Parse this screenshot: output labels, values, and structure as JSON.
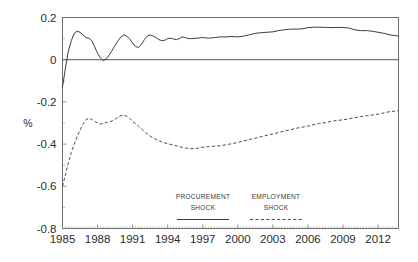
{
  "chart_data": {
    "type": "line",
    "title": "",
    "xlabel": "",
    "ylabel": "%",
    "ylim": [
      -0.8,
      0.2
    ],
    "xlim": [
      1985.0,
      2013.75
    ],
    "yticks": [
      "0.2",
      "0",
      "-0.2",
      "-0.4",
      "-0.6",
      "-0.8"
    ],
    "ytick_values": [
      0.2,
      0,
      -0.2,
      -0.4,
      -0.6,
      -0.8
    ],
    "xticks": [
      "1985",
      "1988",
      "1991",
      "1994",
      "1997",
      "2000",
      "2003",
      "2006",
      "2009",
      "2012"
    ],
    "xtick_values": [
      1985,
      1988,
      1991,
      1994,
      1997,
      2000,
      2003,
      2006,
      2009,
      2012
    ],
    "grid": false,
    "zero_reference_line": 0,
    "legend_position": "inside-bottom-center",
    "series": [
      {
        "name": "PROCUREMENT SHOCK",
        "style": "solid",
        "color": "#3d3d3d",
        "x": [
          1985.0,
          1985.25,
          1985.5,
          1985.75,
          1986.0,
          1986.25,
          1986.5,
          1986.75,
          1987.0,
          1987.25,
          1987.5,
          1987.75,
          1988.0,
          1988.25,
          1988.5,
          1988.75,
          1989.0,
          1989.25,
          1989.5,
          1989.75,
          1990.0,
          1990.25,
          1990.5,
          1990.75,
          1991.0,
          1991.25,
          1991.5,
          1991.75,
          1992.0,
          1992.25,
          1992.5,
          1992.75,
          1993.0,
          1993.25,
          1993.5,
          1993.75,
          1994.0,
          1994.25,
          1994.5,
          1994.75,
          1995.0,
          1995.25,
          1995.5,
          1995.75,
          1996.0,
          1996.5,
          1997.0,
          1997.5,
          1998.0,
          1998.5,
          1999.0,
          1999.5,
          2000.0,
          2000.5,
          2001.0,
          2001.5,
          2002.0,
          2002.5,
          2003.0,
          2003.5,
          2004.0,
          2004.5,
          2005.0,
          2005.5,
          2006.0,
          2006.5,
          2007.0,
          2007.5,
          2008.0,
          2008.5,
          2009.0,
          2009.5,
          2010.0,
          2010.5,
          2011.0,
          2011.5,
          2012.0,
          2012.5,
          2013.0,
          2013.75
        ],
        "y": [
          -0.13,
          -0.04,
          0.04,
          0.09,
          0.125,
          0.135,
          0.13,
          0.118,
          0.105,
          0.102,
          0.09,
          0.062,
          0.03,
          0.008,
          -0.005,
          0.005,
          0.022,
          0.045,
          0.068,
          0.09,
          0.108,
          0.118,
          0.112,
          0.098,
          0.078,
          0.062,
          0.058,
          0.072,
          0.095,
          0.112,
          0.118,
          0.112,
          0.105,
          0.095,
          0.09,
          0.092,
          0.1,
          0.102,
          0.098,
          0.095,
          0.1,
          0.108,
          0.105,
          0.1,
          0.1,
          0.102,
          0.105,
          0.102,
          0.105,
          0.108,
          0.108,
          0.11,
          0.108,
          0.112,
          0.118,
          0.125,
          0.128,
          0.13,
          0.132,
          0.138,
          0.142,
          0.145,
          0.145,
          0.146,
          0.152,
          0.154,
          0.154,
          0.153,
          0.152,
          0.153,
          0.153,
          0.15,
          0.142,
          0.138,
          0.138,
          0.135,
          0.13,
          0.125,
          0.118,
          0.112
        ]
      },
      {
        "name": "EMPLOYMENT SHOCK",
        "style": "dashed",
        "color": "#4a4a4a",
        "x": [
          1985.0,
          1985.25,
          1985.5,
          1985.75,
          1986.0,
          1986.25,
          1986.5,
          1986.75,
          1987.0,
          1987.25,
          1987.5,
          1987.75,
          1988.0,
          1988.25,
          1988.5,
          1988.75,
          1989.0,
          1989.25,
          1989.5,
          1989.75,
          1990.0,
          1990.25,
          1990.5,
          1990.75,
          1991.0,
          1991.5,
          1992.0,
          1992.5,
          1993.0,
          1993.5,
          1994.0,
          1994.5,
          1995.0,
          1995.5,
          1996.0,
          1996.5,
          1997.0,
          1997.5,
          1998.0,
          1998.5,
          1999.0,
          1999.5,
          2000.0,
          2000.5,
          2001.0,
          2001.5,
          2002.0,
          2002.5,
          2003.0,
          2003.5,
          2004.0,
          2004.5,
          2005.0,
          2005.5,
          2006.0,
          2006.5,
          2007.0,
          2007.5,
          2008.0,
          2008.5,
          2009.0,
          2009.5,
          2010.0,
          2010.5,
          2011.0,
          2011.5,
          2012.0,
          2012.5,
          2013.0,
          2013.75
        ],
        "y": [
          -0.6,
          -0.545,
          -0.49,
          -0.44,
          -0.4,
          -0.365,
          -0.335,
          -0.305,
          -0.285,
          -0.277,
          -0.283,
          -0.292,
          -0.3,
          -0.305,
          -0.302,
          -0.298,
          -0.295,
          -0.29,
          -0.282,
          -0.272,
          -0.265,
          -0.263,
          -0.268,
          -0.278,
          -0.292,
          -0.315,
          -0.34,
          -0.362,
          -0.378,
          -0.39,
          -0.398,
          -0.405,
          -0.412,
          -0.418,
          -0.422,
          -0.42,
          -0.415,
          -0.412,
          -0.41,
          -0.408,
          -0.403,
          -0.398,
          -0.392,
          -0.385,
          -0.378,
          -0.372,
          -0.365,
          -0.358,
          -0.352,
          -0.345,
          -0.338,
          -0.332,
          -0.325,
          -0.32,
          -0.315,
          -0.308,
          -0.302,
          -0.298,
          -0.292,
          -0.288,
          -0.285,
          -0.28,
          -0.275,
          -0.27,
          -0.266,
          -0.262,
          -0.258,
          -0.252,
          -0.246,
          -0.242
        ]
      }
    ],
    "legend": [
      {
        "label_line1": "PROCUREMENT",
        "label_line2": "SHOCK",
        "style": "solid"
      },
      {
        "label_line1": "EMPLOYMENT",
        "label_line2": "SHOCK",
        "style": "dashed"
      }
    ]
  }
}
